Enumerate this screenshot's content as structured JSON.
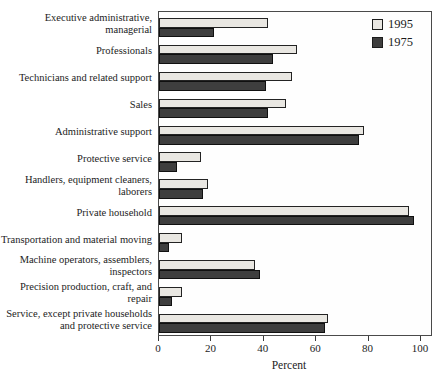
{
  "chart_data": {
    "type": "bar",
    "orientation": "horizontal",
    "title": "",
    "xlabel": "Percent",
    "ylabel": "",
    "xticks": [
      0,
      20,
      40,
      60,
      80,
      100
    ],
    "xlim": [
      0,
      104.6
    ],
    "grid": false,
    "legend_position": "top-right-inside",
    "categories": [
      "Executive administrative, managerial",
      "Professionals",
      "Technicians and related support",
      "Sales",
      "Administrative support",
      "Protective service",
      "Handlers, equipment cleaners, laborers",
      "Private household",
      "Transportation and material moving",
      "Machine operators, assemblers, inspectors",
      "Precision production, craft, and repair",
      "Service, except private households and protective service"
    ],
    "series": [
      {
        "name": "1995",
        "values": [
          42,
          53,
          51,
          49,
          79,
          16,
          19,
          96,
          9,
          37,
          9,
          65
        ]
      },
      {
        "name": "1975",
        "values": [
          21,
          44,
          41,
          42,
          77,
          7,
          17,
          98,
          4,
          39,
          5,
          64
        ]
      }
    ],
    "colors": {
      "1995": "#e9e7e2",
      "1975": "#3e3e3e",
      "bar_border": "#232323",
      "plot_border": "#4a4a4a",
      "text": "#1c1c1c"
    }
  }
}
